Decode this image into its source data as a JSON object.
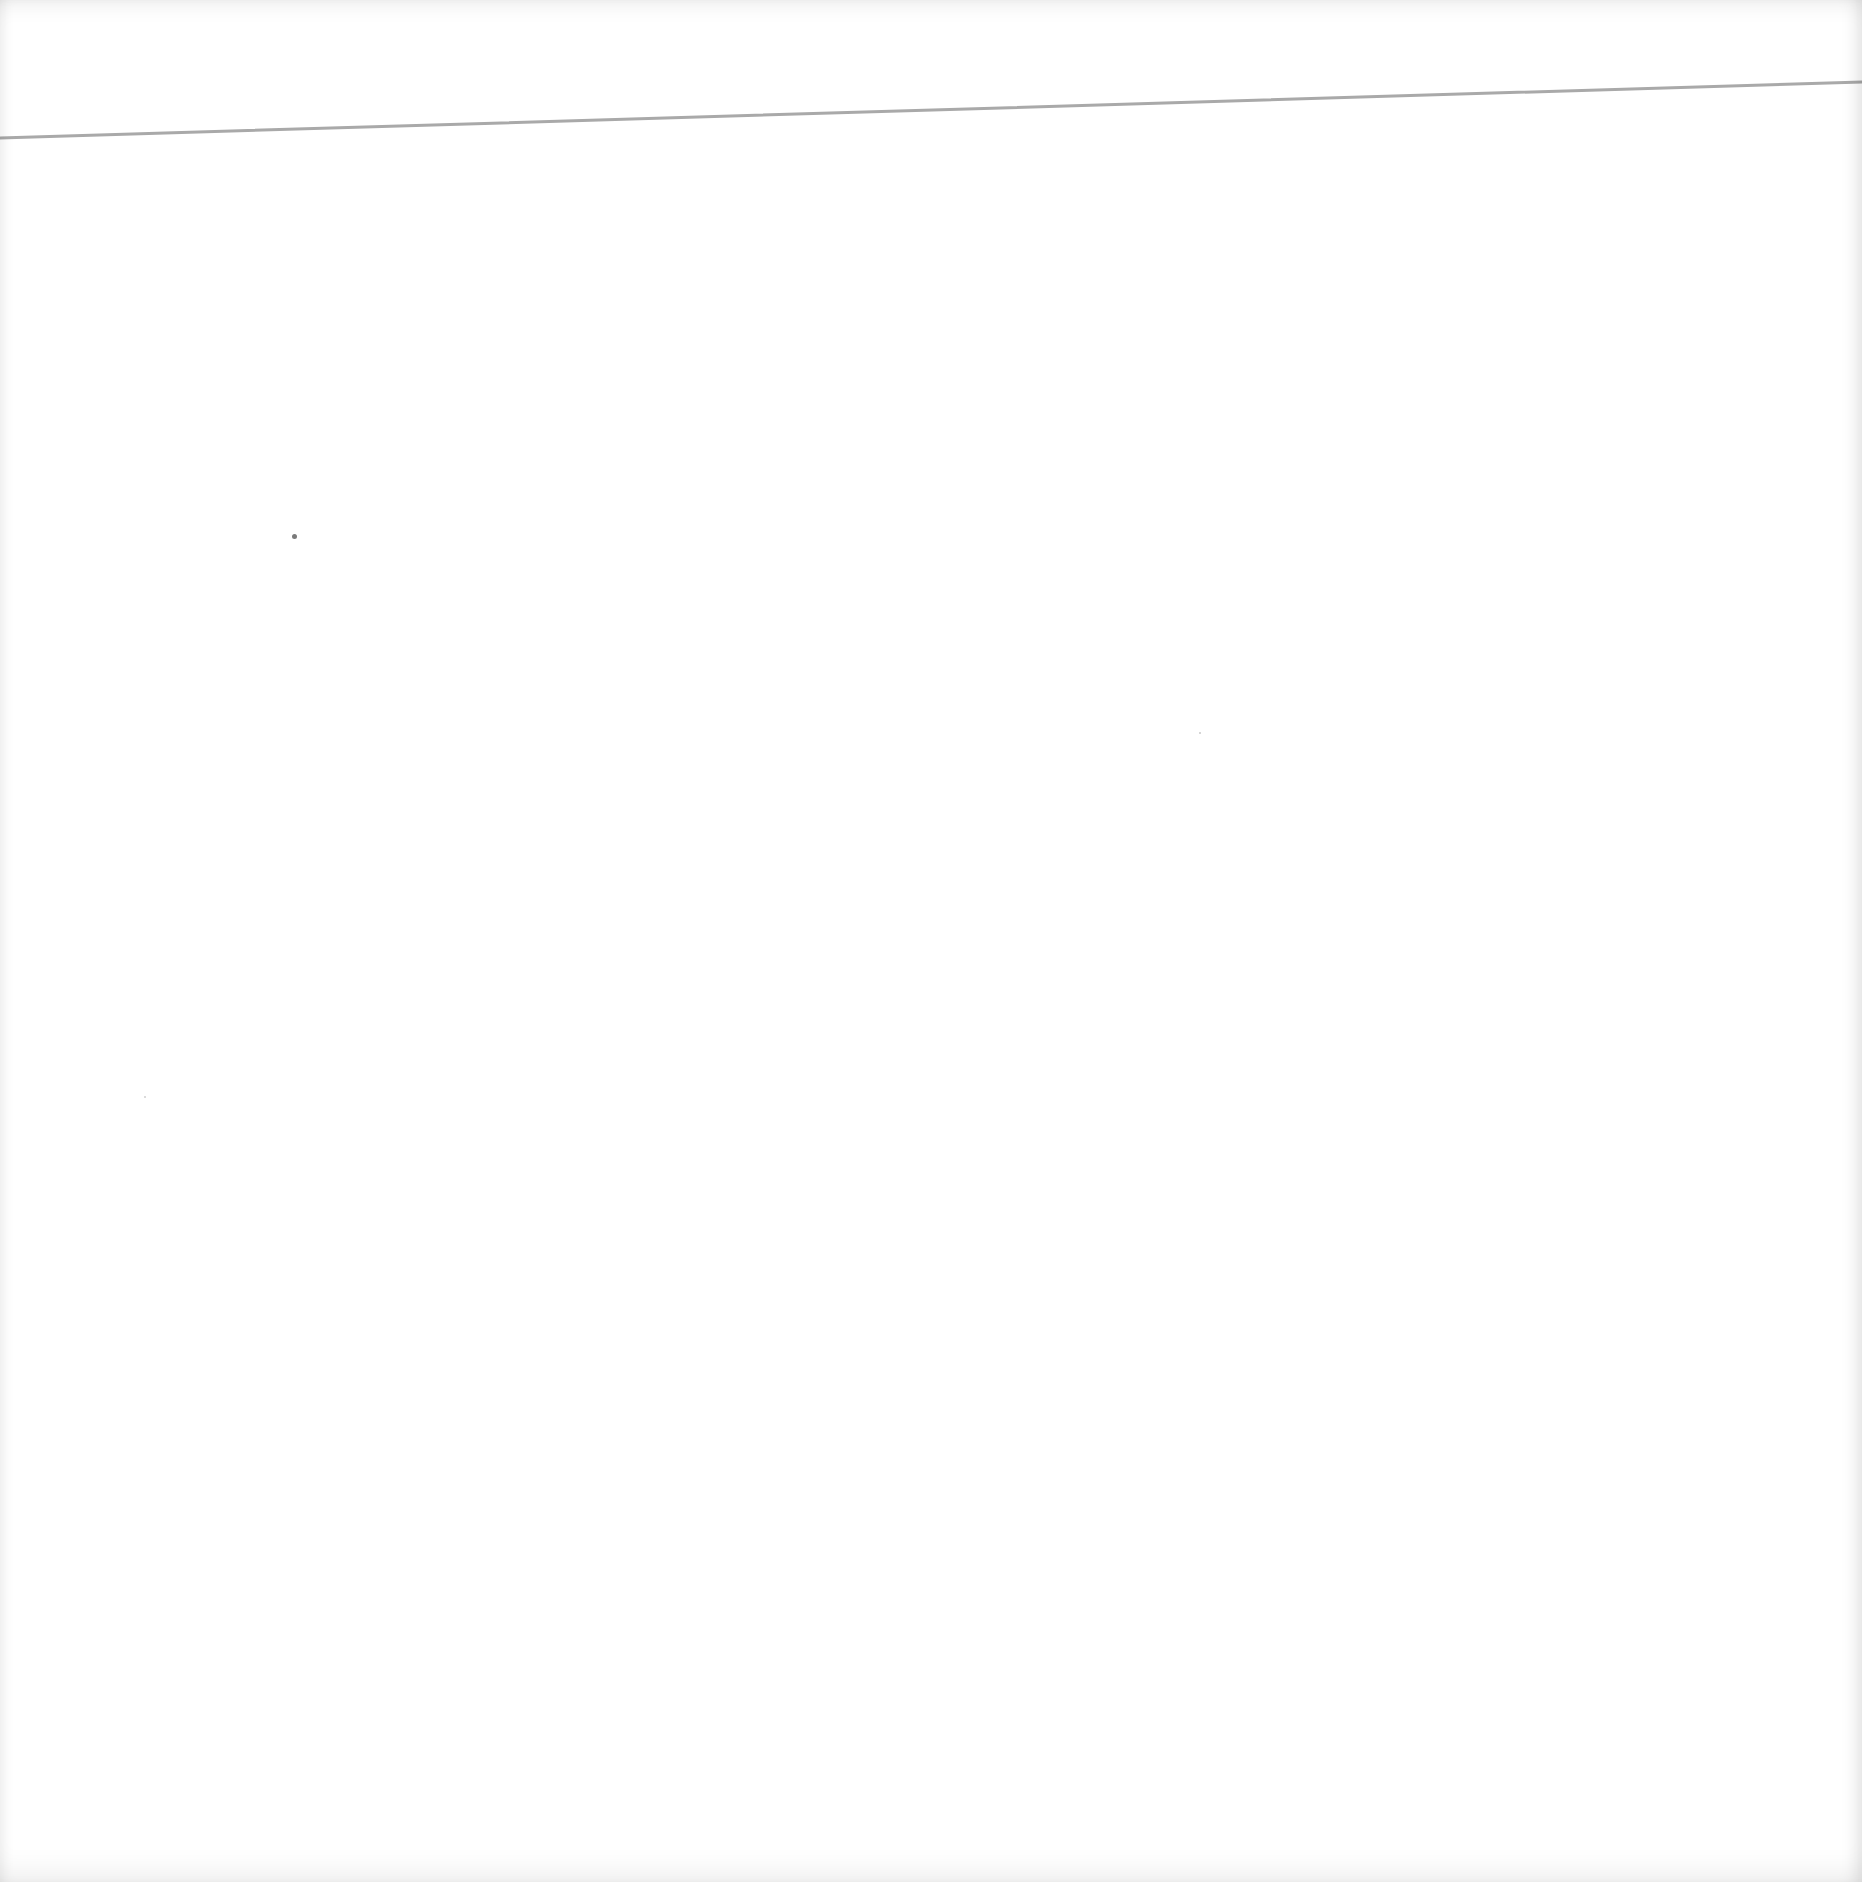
{
  "page": {
    "background_color": "#ffffff",
    "width": 1862,
    "height": 1882
  },
  "rule": {
    "color": "#a9a9a9",
    "x1": 0,
    "y1": 138,
    "x2": 1862,
    "y2": 82,
    "thickness": 3
  },
  "specks": [
    {
      "x": 294,
      "y": 536,
      "size": 5,
      "color": "#7a7a7a"
    },
    {
      "x": 1200,
      "y": 733,
      "size": 2,
      "color": "#c8c8c8"
    },
    {
      "x": 145,
      "y": 1097,
      "size": 2,
      "color": "#cfcfcf"
    }
  ]
}
